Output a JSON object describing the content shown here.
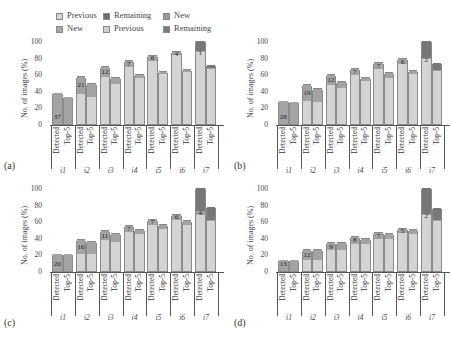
{
  "legend": {
    "row1": [
      {
        "label": "Previous",
        "color": "#d6d6d6"
      },
      {
        "label": "Remaining",
        "color": "#6e6e6e"
      },
      {
        "label": "New",
        "color": "#9a9a9a"
      }
    ],
    "row2": [
      {
        "label": "New",
        "color": "#a8a8a8"
      },
      {
        "label": "Previous",
        "color": "#cfcfcf"
      },
      {
        "label": "Remaining",
        "color": "#7a7a7a"
      }
    ]
  },
  "colors": {
    "previous": "#d4d4d4",
    "new": "#a3a3a3",
    "remaining": "#777777",
    "axis": "#555555"
  },
  "axis": {
    "ylabel": "No. of images (%)",
    "yticks": [
      "0",
      "20",
      "40",
      "60",
      "80",
      "100"
    ],
    "bar_labels": [
      "Detected",
      "Top-5"
    ],
    "categories": [
      "i1",
      "i2",
      "i3",
      "i4",
      "i5",
      "i6",
      "i7"
    ]
  },
  "panels": [
    {
      "id": "a",
      "label": "(a)"
    },
    {
      "id": "b",
      "label": "(b)"
    },
    {
      "id": "c",
      "label": "(c)"
    },
    {
      "id": "d",
      "label": "(d)"
    }
  ],
  "chart_data": [
    {
      "type": "bar",
      "panel": "(a)",
      "stacked": true,
      "title": "",
      "xlabel": "",
      "ylabel": "No. of images (%)",
      "ylim": [
        0,
        100
      ],
      "categories": [
        "i1",
        "i2",
        "i3",
        "i4",
        "i5",
        "i6",
        "i7"
      ],
      "detected": {
        "previous": [
          0,
          36,
          57,
          69,
          76,
          83,
          87
        ],
        "new": [
          37,
          21,
          12,
          7,
          6,
          4,
          1
        ],
        "remaining": [
          0,
          0,
          0,
          0,
          0,
          0,
          12
        ],
        "labels": [
          "37",
          "21",
          "12",
          "7",
          "6",
          "4",
          "1"
        ]
      },
      "top5": {
        "previous": [
          0,
          32,
          48,
          56,
          60,
          63,
          66
        ],
        "new": [
          32,
          16,
          8,
          3,
          3,
          2,
          1
        ],
        "remaining": [
          0,
          0,
          0,
          0,
          0,
          0,
          4
        ]
      }
    },
    {
      "type": "bar",
      "panel": "(b)",
      "stacked": true,
      "title": "",
      "xlabel": "",
      "ylabel": "No. of images (%)",
      "ylim": [
        0,
        100
      ],
      "categories": [
        "i1",
        "i2",
        "i3",
        "i4",
        "i5",
        "i6",
        "i7"
      ],
      "detected": {
        "previous": [
          0,
          28,
          47,
          59,
          66,
          72,
          78
        ],
        "new": [
          28,
          19,
          12,
          7,
          7,
          6,
          2
        ],
        "remaining": [
          0,
          0,
          0,
          0,
          0,
          0,
          20
        ],
        "labels": [
          "28",
          "19",
          "12",
          "7",
          "7",
          "6",
          "2"
        ]
      },
      "top5": {
        "previous": [
          0,
          26,
          43,
          52,
          56,
          60,
          64
        ],
        "new": [
          26,
          16,
          8,
          4,
          5,
          4,
          1
        ],
        "remaining": [
          0,
          0,
          0,
          0,
          0,
          0,
          9
        ]
      }
    },
    {
      "type": "bar",
      "panel": "(c)",
      "stacked": true,
      "title": "",
      "xlabel": "",
      "ylabel": "No. of images (%)",
      "ylim": [
        0,
        100
      ],
      "categories": [
        "i1",
        "i2",
        "i3",
        "i4",
        "i5",
        "i6",
        "i7"
      ],
      "detected": {
        "previous": [
          0,
          21,
          37,
          47,
          55,
          62,
          68
        ],
        "new": [
          20,
          16,
          11,
          7,
          7,
          6,
          4
        ],
        "remaining": [
          0,
          0,
          0,
          0,
          0,
          0,
          28
        ],
        "labels": [
          "20",
          "16",
          "11",
          "7",
          "7",
          "6",
          "4"
        ]
      },
      "top5": {
        "previous": [
          0,
          20,
          35,
          44,
          50,
          56,
          60
        ],
        "new": [
          20,
          15,
          9,
          5,
          6,
          4,
          2
        ],
        "remaining": [
          0,
          0,
          0,
          0,
          0,
          0,
          15
        ]
      }
    },
    {
      "type": "bar",
      "panel": "(d)",
      "stacked": true,
      "title": "",
      "xlabel": "",
      "ylabel": "No. of images (%)",
      "ylim": [
        0,
        100
      ],
      "categories": [
        "i1",
        "i2",
        "i3",
        "i4",
        "i5",
        "i6",
        "i7"
      ],
      "detected": {
        "previous": [
          0,
          13,
          25,
          33,
          39,
          46,
          67
        ],
        "new": [
          13,
          12,
          9,
          8,
          7,
          5,
          2
        ],
        "remaining": [
          0,
          0,
          0,
          0,
          0,
          0,
          31
        ],
        "labels": [
          "13",
          "12",
          "9",
          "8",
          "7",
          "5",
          "2"
        ]
      },
      "top5": {
        "previous": [
          0,
          13,
          25,
          33,
          39,
          44,
          60
        ],
        "new": [
          13,
          12,
          9,
          6,
          6,
          5,
          1
        ],
        "remaining": [
          0,
          0,
          0,
          0,
          0,
          0,
          15
        ]
      }
    }
  ]
}
